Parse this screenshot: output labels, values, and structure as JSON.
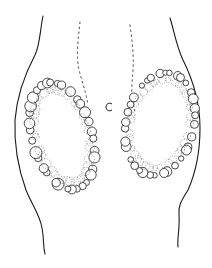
{
  "figure": {
    "type": "scientific line illustration",
    "style": "black ink on white",
    "background_color": "#ffffff",
    "ink_color": "#1a1a1a",
    "parts": {
      "body_outline": {
        "left_edge": "curved contour",
        "right_edge": "curved contour"
      },
      "center_lines": {
        "left": "dotted line",
        "right": "dotted line"
      },
      "center_mark": "small open c-shaped mark",
      "left_cluster": "oval ring of bubble-like cells",
      "right_cluster": "oval ring of bubble-like cells"
    }
  }
}
